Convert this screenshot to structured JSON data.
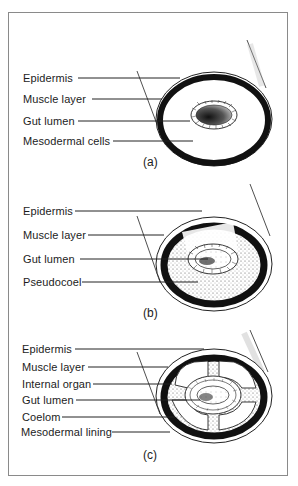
{
  "figure": {
    "panels": [
      {
        "id": "a",
        "caption": "(a)",
        "type": "acoelomate",
        "labels": [
          "Epidermis",
          "Muscle layer",
          "Gut lumen",
          "Mesodermal cells"
        ]
      },
      {
        "id": "b",
        "caption": "(b)",
        "type": "pseudocoelomate",
        "labels": [
          "Epidermis",
          "Muscle layer",
          "Gut lumen",
          "Pseudocoel"
        ]
      },
      {
        "id": "c",
        "caption": "(c)",
        "type": "coelomate",
        "labels": [
          "Epidermis",
          "Muscle layer",
          "Internal organ",
          "Gut lumen",
          "Coelom",
          "Mesodermal lining"
        ]
      }
    ]
  },
  "colors": {
    "ink": "#1a1a1a",
    "frame": "#8a8a8a",
    "stipple": "#6a6a6a",
    "background": "#ffffff"
  }
}
